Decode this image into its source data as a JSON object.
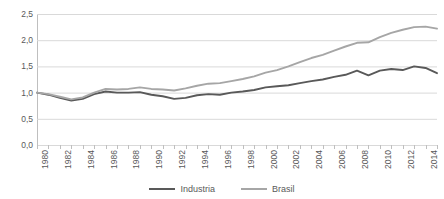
{
  "chart_title": "",
  "colors": {
    "industria": "#595959",
    "brasil": "#a6a6a6",
    "gridline": "#d9d9d9",
    "axis": "#bfbfbf",
    "text": "#595959",
    "background": "#ffffff"
  },
  "legend": {
    "position": "bottom-center",
    "items": [
      {
        "label": "Industria",
        "color": "#595959"
      },
      {
        "label": "Brasil",
        "color": "#a6a6a6"
      }
    ]
  },
  "yaxis": {
    "labels": [
      "2,5",
      "2,0",
      "1,5",
      "1,0",
      "0,5",
      "0,0"
    ],
    "values": [
      2.5,
      2.0,
      1.5,
      1.0,
      0.5,
      0.0
    ],
    "min": 0.0,
    "max": 2.5,
    "step": 0.5,
    "decimal_separator": ","
  },
  "xaxis": {
    "labels": [
      "1980",
      "1982",
      "1984",
      "1986",
      "1988",
      "1990",
      "1992",
      "1994",
      "1996",
      "1998",
      "2000",
      "2002",
      "2004",
      "2006",
      "2008",
      "2010",
      "2012",
      "2014"
    ],
    "label_rotation": -90,
    "tick_interval_years": 1,
    "label_interval_years": 2,
    "min": 1980,
    "max": 2015
  },
  "chart_data": {
    "type": "line",
    "title": "",
    "xlabel": "",
    "ylabel": "",
    "ylim": [
      0.0,
      2.5
    ],
    "xlim": [
      1980,
      2015
    ],
    "grid": "horizontal",
    "legend_position": "bottom-center",
    "x": [
      1980,
      1981,
      1982,
      1983,
      1984,
      1985,
      1986,
      1987,
      1988,
      1989,
      1990,
      1991,
      1992,
      1993,
      1994,
      1995,
      1996,
      1997,
      1998,
      1999,
      2000,
      2001,
      2002,
      2003,
      2004,
      2005,
      2006,
      2007,
      2008,
      2009,
      2010,
      2011,
      2012,
      2013,
      2014,
      2015
    ],
    "series": [
      {
        "name": "Industria",
        "color": "#595959",
        "values": [
          1.0,
          0.96,
          0.9,
          0.85,
          0.88,
          0.97,
          1.02,
          1.0,
          1.0,
          1.01,
          0.96,
          0.93,
          0.88,
          0.9,
          0.95,
          0.97,
          0.96,
          1.0,
          1.02,
          1.05,
          1.1,
          1.12,
          1.14,
          1.18,
          1.22,
          1.25,
          1.3,
          1.34,
          1.42,
          1.33,
          1.42,
          1.45,
          1.43,
          1.5,
          1.47,
          1.37
        ]
      },
      {
        "name": "Brasil",
        "color": "#a6a6a6",
        "values": [
          1.0,
          0.97,
          0.92,
          0.87,
          0.91,
          1.0,
          1.07,
          1.06,
          1.07,
          1.1,
          1.07,
          1.06,
          1.04,
          1.08,
          1.13,
          1.17,
          1.18,
          1.22,
          1.26,
          1.31,
          1.38,
          1.43,
          1.5,
          1.58,
          1.66,
          1.72,
          1.8,
          1.88,
          1.95,
          1.96,
          2.06,
          2.14,
          2.2,
          2.25,
          2.26,
          2.22
        ]
      }
    ]
  }
}
